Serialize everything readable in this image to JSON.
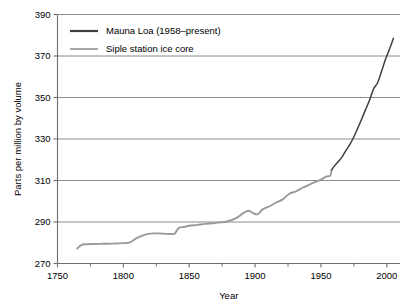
{
  "chart_data": {
    "type": "line",
    "title": "",
    "xlabel": "Year",
    "ylabel": "Parts per million by volume",
    "xlim": [
      1750,
      2010
    ],
    "ylim": [
      270,
      390
    ],
    "xticks": [
      1750,
      1800,
      1850,
      1900,
      1950,
      2000
    ],
    "xtick_labels": [
      "1750",
      "1800",
      "1850",
      "1900",
      "1950",
      "2000"
    ],
    "xminor_ticks": [
      1775,
      1825,
      1875,
      1925,
      1975
    ],
    "yticks": [
      270,
      290,
      310,
      330,
      350,
      370,
      390
    ],
    "ytick_labels": [
      "270",
      "290",
      "310",
      "330",
      "350",
      "370",
      "390"
    ],
    "grid": "horizontal",
    "legend_position": "top-left",
    "colors": {
      "mauna_loa": "#3f3f3f",
      "siple": "#9a9a9a",
      "grid": "#8c8c8c",
      "axis": "#6e6e6e",
      "background": "#ffffff"
    },
    "series": [
      {
        "name": "Mauna Loa (1958–present)",
        "color": "#3f3f3f",
        "x": [
          1958,
          1960,
          1963,
          1966,
          1969,
          1972,
          1975,
          1978,
          1981,
          1984,
          1987,
          1990,
          1993,
          1996,
          1999,
          2002,
          2005
        ],
        "values": [
          315,
          316.8,
          319,
          321.3,
          324.5,
          327.4,
          331.1,
          335.3,
          339.8,
          344.4,
          348.9,
          354.2,
          357.1,
          362.6,
          368.4,
          373.2,
          378.5
        ]
      },
      {
        "name": "Siple station ice core",
        "color": "#9a9a9a",
        "x": [
          1765,
          1768,
          1772,
          1778,
          1785,
          1792,
          1800,
          1805,
          1810,
          1815,
          1820,
          1826,
          1832,
          1836,
          1839,
          1842,
          1846,
          1850,
          1856,
          1862,
          1868,
          1874,
          1880,
          1886,
          1891,
          1895,
          1899,
          1902,
          1906,
          1911,
          1916,
          1921,
          1926,
          1931,
          1936,
          1941,
          1946,
          1950,
          1954,
          1957,
          1958
        ],
        "values": [
          277.2,
          278.9,
          279.3,
          279.4,
          279.5,
          279.6,
          279.8,
          280.2,
          282.2,
          283.6,
          284.4,
          284.5,
          284.3,
          284.2,
          284.4,
          287.1,
          287.6,
          288.2,
          288.6,
          289.1,
          289.4,
          289.8,
          290.5,
          292.0,
          294.3,
          295.4,
          294.1,
          293.8,
          296.2,
          297.6,
          299.4,
          300.9,
          303.6,
          304.8,
          306.5,
          307.9,
          309.4,
          310.4,
          311.9,
          312.3,
          315.0
        ]
      }
    ]
  }
}
